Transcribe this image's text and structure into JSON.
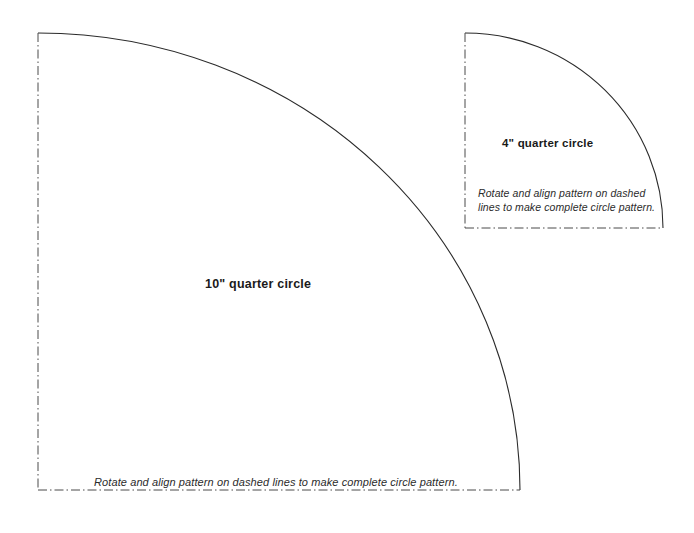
{
  "page": {
    "background_color": "#ffffff",
    "width": 694,
    "height": 533
  },
  "style": {
    "arc_color": "#2b2b2b",
    "dash_line_color": "#4a4a4a",
    "text_color": "#1a1a1a",
    "note_color": "#2b2b2b",
    "line_style": "dash-dot"
  },
  "shapes": {
    "large_quarter_circle": {
      "label": "10\" quarter circle",
      "note": "Rotate and align pattern on dashed lines to make complete circle pattern.",
      "corner_x": 38,
      "corner_y": 490,
      "radius_x": 482,
      "radius_y": 457,
      "arc_start_x": 38,
      "arc_start_y": 33,
      "arc_end_x": 520,
      "arc_end_y": 490,
      "dashed_edges": [
        "vertical-left",
        "horizontal-bottom"
      ]
    },
    "small_quarter_circle": {
      "label": "4\" quarter circle",
      "note_line_1": "Rotate and align pattern on dashed",
      "note_line_2": "lines to make complete circle pattern.",
      "corner_x": 465,
      "corner_y": 228,
      "radius_x": 198,
      "radius_y": 195,
      "arc_start_x": 465,
      "arc_start_y": 33,
      "arc_end_x": 663,
      "arc_end_y": 228,
      "dashed_edges": [
        "vertical-left",
        "horizontal-bottom"
      ]
    }
  }
}
